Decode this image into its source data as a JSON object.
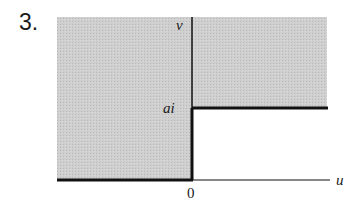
{
  "problem_number": "3.",
  "diagram": {
    "axis_labels": {
      "vertical": "v",
      "horizontal": "u"
    },
    "origin_label": "0",
    "level_label": "ai",
    "colors": {
      "shade": "#c9c9c9",
      "line": "#111111",
      "background": "#ffffff"
    }
  }
}
